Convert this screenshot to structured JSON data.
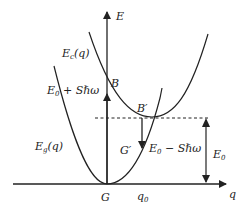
{
  "diagram": {
    "axes": {
      "x_label": "q",
      "y_label": "E"
    },
    "curves": {
      "ground": {
        "label": "E",
        "label_sub": "g",
        "label_tail": "(q)"
      },
      "excited": {
        "label": "E",
        "label_sub": "c",
        "label_tail": "(q)"
      }
    },
    "points": {
      "G": "G",
      "B": "B",
      "B_prime": "B′",
      "G_prime": "G′",
      "q0": "q",
      "q0_sub": "0"
    },
    "energies": {
      "absorption": {
        "main": "E",
        "sub": "0",
        "tail": " + Sℏω"
      },
      "emission": {
        "main": "E",
        "sub": "0",
        "tail": " − Sℏω"
      },
      "e0": {
        "main": "E",
        "sub": "0"
      }
    },
    "colors": {
      "line": "#222222",
      "background": "#ffffff"
    }
  }
}
